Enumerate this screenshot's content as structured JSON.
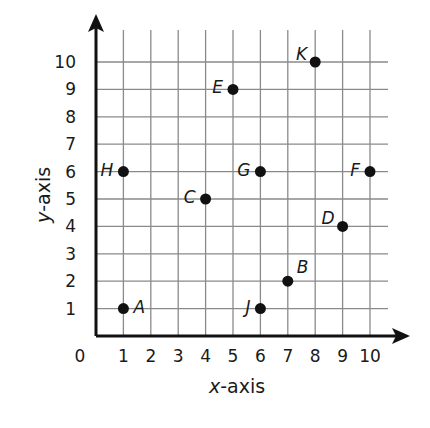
{
  "chart_data": {
    "type": "scatter",
    "title": "",
    "xlabel": "x-axis",
    "ylabel": "y-axis",
    "xlim": [
      0,
      10
    ],
    "ylim": [
      0,
      10
    ],
    "grid": true,
    "x_ticks": [
      "0",
      "1",
      "2",
      "3",
      "4",
      "5",
      "6",
      "7",
      "8",
      "9",
      "10"
    ],
    "y_ticks": [
      "1",
      "2",
      "3",
      "4",
      "5",
      "6",
      "7",
      "8",
      "9",
      "10"
    ],
    "points": [
      {
        "label": "A",
        "x": 1,
        "y": 1,
        "label_pos": "right"
      },
      {
        "label": "B",
        "x": 7,
        "y": 2,
        "label_pos": "upper-right"
      },
      {
        "label": "C",
        "x": 4,
        "y": 5,
        "label_pos": "left"
      },
      {
        "label": "D",
        "x": 9,
        "y": 4,
        "label_pos": "upper-left"
      },
      {
        "label": "E",
        "x": 5,
        "y": 9,
        "label_pos": "left"
      },
      {
        "label": "F",
        "x": 10,
        "y": 6,
        "label_pos": "left"
      },
      {
        "label": "G",
        "x": 6,
        "y": 6,
        "label_pos": "left"
      },
      {
        "label": "H",
        "x": 1,
        "y": 6,
        "label_pos": "left"
      },
      {
        "label": "J",
        "x": 6,
        "y": 1,
        "label_pos": "left"
      },
      {
        "label": "K",
        "x": 8,
        "y": 10,
        "label_pos": "upper-left"
      }
    ],
    "colors": {
      "grid": "#8a8a8a",
      "axis": "#111111",
      "point": "#111111",
      "text": "#1a1a1a"
    }
  }
}
